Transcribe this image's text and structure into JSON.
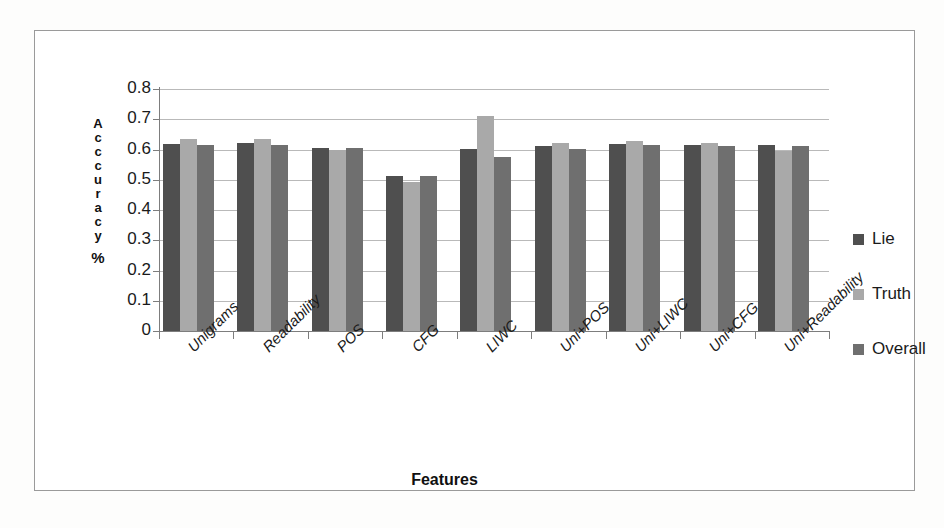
{
  "chart_data": {
    "type": "bar",
    "title": "",
    "xlabel": "Features",
    "ylabel": "Acccuracy %",
    "ylabel_stacked": [
      "A",
      "c",
      "c",
      "c",
      "u",
      "r",
      "a",
      "c",
      "y"
    ],
    "ylabel_unit": "%",
    "ylim": [
      0,
      0.8
    ],
    "ytick_labels": [
      "0.8",
      "0.7",
      "0.6",
      "0.5",
      "0.4",
      "0.3",
      "0.2",
      "0.1",
      "0"
    ],
    "ytick_values": [
      0.8,
      0.7,
      0.6,
      0.5,
      0.4,
      0.3,
      0.2,
      0.1,
      0
    ],
    "grid": true,
    "legend_position": "right",
    "categories": [
      "Unigrams",
      "Readability",
      "POS",
      "CFG",
      "LIWC",
      "Uni+POS",
      "Uni+LIWC",
      "Uni+CFG",
      "Uni+Readability"
    ],
    "series": [
      {
        "name": "Lie",
        "color": "#4f4f4f",
        "values": [
          0.618,
          0.622,
          0.605,
          0.513,
          0.602,
          0.61,
          0.617,
          0.615,
          0.616
        ]
      },
      {
        "name": "Truth",
        "color": "#a9a9a9",
        "values": [
          0.635,
          0.634,
          0.597,
          0.494,
          0.71,
          0.623,
          0.628,
          0.623,
          0.596
        ]
      },
      {
        "name": "Overall",
        "color": "#6f6f6f",
        "values": [
          0.615,
          0.614,
          0.605,
          0.513,
          0.575,
          0.601,
          0.614,
          0.612,
          0.612
        ]
      }
    ]
  },
  "legend": {
    "items": [
      {
        "label": "Lie",
        "swatch": "lie"
      },
      {
        "label": "Truth",
        "swatch": "truth"
      },
      {
        "label": "Overall",
        "swatch": "overall"
      }
    ]
  }
}
